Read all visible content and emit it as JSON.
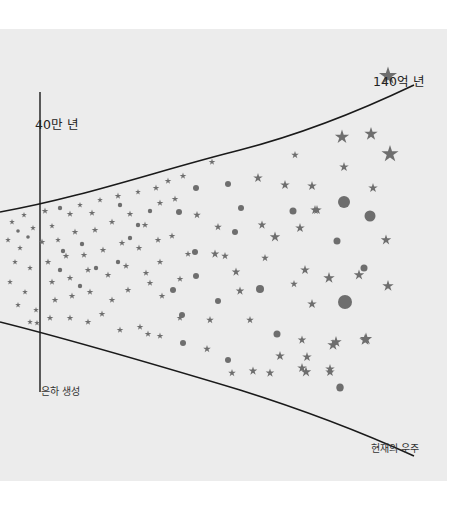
{
  "diagram": {
    "title_markers": {
      "recombination": "40만 년",
      "present_age": "140억 년"
    },
    "annotations": {
      "galaxy_formation": "은하 생성",
      "present_universe": "현재의 우주"
    },
    "colors": {
      "panel_background": "#ececec",
      "page_background": "#ffffff",
      "boundary_line": "#1a1a1a",
      "marker_fill": "#6e6e6e"
    },
    "shape_legend": {
      "star": "star-icon",
      "dot": "dot-icon"
    }
  }
}
